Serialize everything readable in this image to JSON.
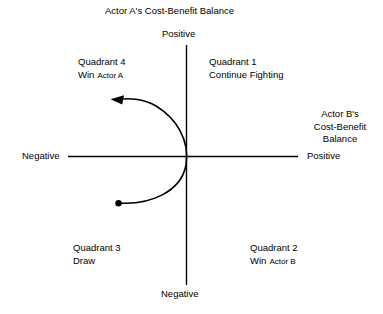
{
  "diagram": {
    "title_top": "Actor A's Cost-Benefit Balance",
    "vertical_axis": {
      "positive_label": "Positive",
      "negative_label": "Negative"
    },
    "horizontal_axis": {
      "negative_label": "Negative",
      "positive_label": "Positive",
      "title_lines": {
        "line1": "Actor B's",
        "line2": "Cost-Benefit",
        "line3": "Balance"
      }
    },
    "quadrants": {
      "q1": {
        "name": "Quadrant 1",
        "outcome": "Continue Fighting"
      },
      "q2": {
        "name": "Quadrant 2",
        "outcome": "Win",
        "actor": "Actor B"
      },
      "q3": {
        "name": "Quadrant 3",
        "outcome": "Draw"
      },
      "q4": {
        "name": "Quadrant 4",
        "outcome": "Win",
        "actor": "Actor A"
      }
    },
    "trajectory": {
      "start_marker": "start-dot",
      "end_marker": "arrowhead",
      "direction": "from Quadrant 3 curving rightward through origin then up-left into Quadrant 4"
    },
    "colors": {
      "ink": "#000000",
      "background": "#ffffff"
    }
  }
}
